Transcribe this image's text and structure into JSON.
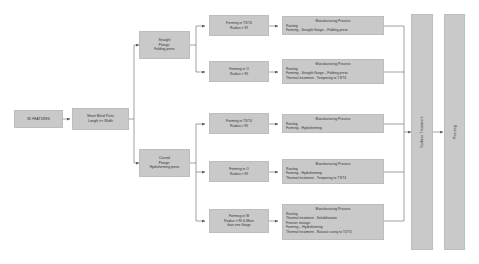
{
  "diagram": {
    "colors": {
      "node_fill": "#c9c9c9",
      "node_border": "#bdbdbd",
      "wire": "#7a7a7a",
      "text": "#2e2e2e",
      "background": "#ffffff"
    }
  },
  "start": {
    "label": "3D FEATURES"
  },
  "input": {
    "line1": "Sheet Metal Parts",
    "line2": "Length >> Width"
  },
  "branches": [
    {
      "id": "straight-flange",
      "line1": "Straight",
      "line2": "Flange:",
      "line3": "Folding press"
    },
    {
      "id": "curved-flange",
      "line1": "Curved",
      "line2": "Flange:",
      "line3": "Hydroforming press"
    }
  ],
  "conditions": [
    {
      "id": "cond-1",
      "line1": "Forming in T3/T4",
      "line2": "Radius > Rf",
      "line3": ""
    },
    {
      "id": "cond-2",
      "line1": "Forming in O",
      "line2": "Radius < Rf",
      "line3": ""
    },
    {
      "id": "cond-3",
      "line1": "Forming in T3/T4",
      "line2": "Radius > Rf",
      "line3": ""
    },
    {
      "id": "cond-4",
      "line1": "Forming in O",
      "line2": "Radius < Rf",
      "line3": ""
    },
    {
      "id": "cond-5",
      "line1": "Forming in W",
      "line2": "Radius < Rf & More",
      "line3": "than one flange"
    }
  ],
  "processes": [
    {
      "id": "proc-1",
      "title": "Manufacturing Process",
      "line1": "Routing",
      "line2": "Forming  - Straight flange – Folding press",
      "line3": "",
      "line4": "",
      "line5": ""
    },
    {
      "id": "proc-2",
      "title": "Manufacturing Process",
      "line1": "Routing",
      "line2": "Forming  - Straight flange – Folding press",
      "line3": "Thermal  treatment  - Tempering to T3/T4",
      "line4": "",
      "line5": ""
    },
    {
      "id": "proc-3",
      "title": "Manufacturing Process",
      "line1": "Routing",
      "line2": "Forming  - Hydroforming",
      "line3": "",
      "line4": "",
      "line5": ""
    },
    {
      "id": "proc-4",
      "title": "Manufacturing Process",
      "line1": "Routing",
      "line2": "Forming  - Hydroforming",
      "line3": "Thermal  treatment  - Tempering to T3/T4",
      "line4": "",
      "line5": ""
    },
    {
      "id": "proc-5",
      "title": "Manufacturing Process",
      "line1": "Routing",
      "line2": "Thermal treatment  - Solubilization",
      "line3": "Freezer storage",
      "line4": "Forming  – Hydroforming",
      "line5": "Thermal treatment  - Natural curing to T3/T4"
    }
  ],
  "stages": [
    {
      "id": "surface-treatment",
      "label": "Surface Treatment"
    },
    {
      "id": "painting",
      "label": "Painting"
    }
  ]
}
